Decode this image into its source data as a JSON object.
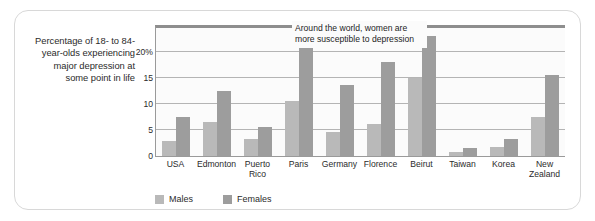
{
  "caption": "Percentage of 18- to 84-year-olds experiencing major depression at some point in life",
  "annotation": "Around the world, women are more susceptible to depression",
  "legend": {
    "males_label": "Males",
    "females_label": "Females",
    "males_color": "#b9b9b9",
    "females_color": "#9d9d9d"
  },
  "chart_data": {
    "type": "bar",
    "title": "",
    "xlabel": "",
    "ylabel": "Percentage of 18- to 84-year-olds experiencing major depression at some point in life",
    "categories": [
      "USA",
      "Edmonton",
      "Puerto Rico",
      "Paris",
      "Germany",
      "Florence",
      "Beirut",
      "Taiwan",
      "Korea",
      "New Zealand"
    ],
    "series": [
      {
        "name": "Males",
        "color": "#b9b9b9",
        "values": [
          2.8,
          6.5,
          3.2,
          10.6,
          4.6,
          6.1,
          15.0,
          0.8,
          1.7,
          7.5
        ]
      },
      {
        "name": "Females",
        "color": "#9d9d9d",
        "values": [
          7.4,
          12.5,
          5.5,
          21.8,
          13.5,
          18.0,
          23.0,
          1.5,
          3.3,
          15.5
        ]
      }
    ],
    "ylim": [
      0,
      24.5
    ],
    "yticks": [
      0,
      5,
      10,
      15,
      20
    ],
    "ytick_labels": [
      "0",
      "5",
      "10",
      "15",
      "20%"
    ],
    "grid": true,
    "legend_position": "bottom-left",
    "annotations": [
      "Around the world, women are more susceptible to depression"
    ]
  }
}
